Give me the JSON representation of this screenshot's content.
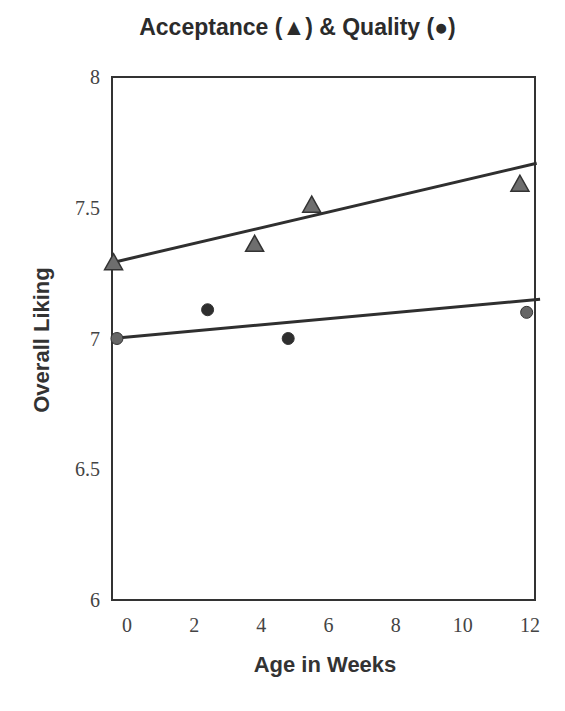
{
  "chart_data": {
    "type": "scatter",
    "title": "Acceptance (▲)  & Quality (●)",
    "xlabel": "Age in Weeks",
    "ylabel": "Overall Liking",
    "xlim": [
      -0.45,
      12.2
    ],
    "ylim": [
      6,
      8
    ],
    "xticks": [
      0,
      2,
      4,
      6,
      8,
      10,
      12
    ],
    "yticks": [
      6,
      6.5,
      7,
      7.5,
      8
    ],
    "ytick_labels": [
      "6",
      "6.5",
      "7",
      "7.5",
      "8"
    ],
    "grid": false,
    "legend": "in title (triangle = Acceptance, circle = Quality)",
    "series": [
      {
        "name": "Acceptance",
        "marker": "triangle",
        "x": [
          -0.4,
          3.8,
          5.5,
          11.7
        ],
        "y": [
          7.29,
          7.36,
          7.51,
          7.59
        ],
        "trendline": {
          "x": [
            -0.45,
            12.2
          ],
          "y": [
            7.29,
            7.67
          ]
        }
      },
      {
        "name": "Quality",
        "marker": "circle",
        "x": [
          -0.3,
          2.4,
          4.8,
          11.9
        ],
        "y": [
          7.0,
          7.11,
          7.0,
          7.1
        ],
        "trendline": {
          "x": [
            -0.45,
            12.3
          ],
          "y": [
            7.0,
            7.15
          ]
        }
      }
    ]
  }
}
